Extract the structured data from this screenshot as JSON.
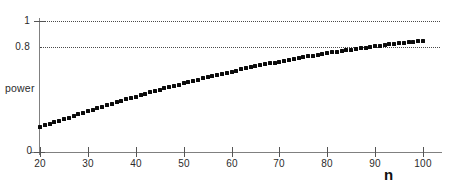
{
  "chart_data": {
    "type": "scatter",
    "title": "",
    "xlabel": "n",
    "ylabel": "power",
    "xlim": [
      20,
      100
    ],
    "ylim": [
      0,
      1
    ],
    "grid": true,
    "legend": null,
    "xticks": [
      20,
      30,
      40,
      50,
      60,
      70,
      80,
      90,
      100
    ],
    "xtick_labels": [
      "20",
      "30",
      "40",
      "50",
      "60",
      "70",
      "80",
      "90",
      "100"
    ],
    "yticks": [
      0,
      0.8,
      1
    ],
    "ytick_labels": [
      "0",
      "0.8",
      "1"
    ],
    "gridline_values": [
      0.8,
      1
    ],
    "origin_label": "0",
    "marker_style": "filled-square",
    "marker_color": "#0a0a0a",
    "series": [
      {
        "name": "power",
        "x": [
          20,
          21,
          22,
          23,
          24,
          25,
          26,
          27,
          28,
          29,
          30,
          31,
          32,
          33,
          34,
          35,
          36,
          37,
          38,
          39,
          40,
          41,
          42,
          43,
          44,
          45,
          46,
          47,
          48,
          49,
          50,
          51,
          52,
          53,
          54,
          55,
          56,
          57,
          58,
          59,
          60,
          61,
          62,
          63,
          64,
          65,
          66,
          67,
          68,
          69,
          70,
          71,
          72,
          73,
          74,
          75,
          76,
          77,
          78,
          79,
          80,
          81,
          82,
          83,
          84,
          85,
          86,
          87,
          88,
          89,
          90,
          91,
          92,
          93,
          94,
          95,
          96,
          97,
          98,
          99,
          100
        ],
        "y": [
          0.191,
          0.203,
          0.215,
          0.227,
          0.239,
          0.251,
          0.263,
          0.275,
          0.287,
          0.299,
          0.311,
          0.322,
          0.334,
          0.345,
          0.357,
          0.368,
          0.379,
          0.39,
          0.401,
          0.412,
          0.423,
          0.434,
          0.444,
          0.455,
          0.465,
          0.475,
          0.485,
          0.495,
          0.505,
          0.515,
          0.525,
          0.534,
          0.543,
          0.553,
          0.562,
          0.571,
          0.58,
          0.588,
          0.597,
          0.605,
          0.614,
          0.622,
          0.63,
          0.638,
          0.646,
          0.654,
          0.661,
          0.669,
          0.676,
          0.683,
          0.69,
          0.697,
          0.704,
          0.711,
          0.717,
          0.724,
          0.73,
          0.736,
          0.742,
          0.748,
          0.754,
          0.76,
          0.766,
          0.771,
          0.777,
          0.782,
          0.787,
          0.792,
          0.797,
          0.802,
          0.807,
          0.812,
          0.817,
          0.821,
          0.826,
          0.83,
          0.835,
          0.839,
          0.843,
          0.847,
          0.851
        ]
      }
    ]
  }
}
